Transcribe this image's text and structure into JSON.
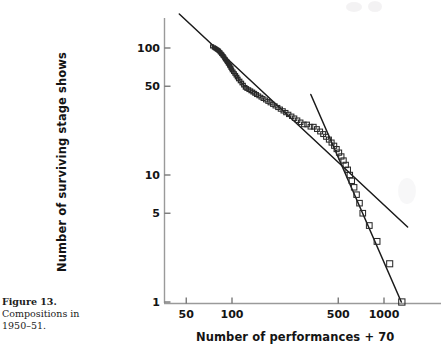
{
  "figure": {
    "caption_title": "Figure 13.",
    "caption_lines": [
      "Compositions in",
      "1950–51."
    ]
  },
  "style": {
    "ink": "#141414",
    "marker_stroke": "#2a2a2a",
    "axis_color": "#9a9a9a",
    "fit_line_color": "#1a1a1a",
    "background": "#ffffff"
  },
  "chart_data": {
    "type": "scatter",
    "title": "",
    "subtitle": "",
    "xlabel": "Number of performances + 70",
    "ylabel": "Number of surviving stage shows",
    "xscale": "log",
    "yscale": "log",
    "xlim": [
      42,
      1450
    ],
    "ylim": [
      0.88,
      215
    ],
    "grid": false,
    "legend": null,
    "xticks": [
      50,
      100,
      500,
      1000
    ],
    "xtick_labels": [
      "50",
      "100",
      "500",
      "1000"
    ],
    "yticks": [
      1,
      5,
      10,
      50,
      100
    ],
    "ytick_labels": [
      "1",
      "5",
      "10",
      "50",
      "100"
    ],
    "marker": "open-square",
    "points": [
      {
        "x": 74,
        "y": 103
      },
      {
        "x": 76,
        "y": 101
      },
      {
        "x": 77,
        "y": 100
      },
      {
        "x": 78,
        "y": 99
      },
      {
        "x": 79,
        "y": 98
      },
      {
        "x": 80,
        "y": 97
      },
      {
        "x": 81,
        "y": 96
      },
      {
        "x": 82,
        "y": 95
      },
      {
        "x": 83,
        "y": 93
      },
      {
        "x": 84,
        "y": 92
      },
      {
        "x": 85,
        "y": 90
      },
      {
        "x": 86,
        "y": 89
      },
      {
        "x": 87,
        "y": 87
      },
      {
        "x": 88,
        "y": 86
      },
      {
        "x": 89,
        "y": 84
      },
      {
        "x": 90,
        "y": 82
      },
      {
        "x": 91,
        "y": 81
      },
      {
        "x": 92,
        "y": 79
      },
      {
        "x": 93,
        "y": 78
      },
      {
        "x": 94,
        "y": 76
      },
      {
        "x": 95,
        "y": 75
      },
      {
        "x": 96,
        "y": 73
      },
      {
        "x": 97,
        "y": 72
      },
      {
        "x": 98,
        "y": 70
      },
      {
        "x": 99,
        "y": 69
      },
      {
        "x": 100,
        "y": 67
      },
      {
        "x": 102,
        "y": 65
      },
      {
        "x": 104,
        "y": 63
      },
      {
        "x": 106,
        "y": 61
      },
      {
        "x": 108,
        "y": 59
      },
      {
        "x": 110,
        "y": 57
      },
      {
        "x": 113,
        "y": 55
      },
      {
        "x": 116,
        "y": 53
      },
      {
        "x": 119,
        "y": 51
      },
      {
        "x": 122,
        "y": 49
      },
      {
        "x": 125,
        "y": 48
      },
      {
        "x": 129,
        "y": 47
      },
      {
        "x": 133,
        "y": 46
      },
      {
        "x": 137,
        "y": 45
      },
      {
        "x": 141,
        "y": 44
      },
      {
        "x": 145,
        "y": 43
      },
      {
        "x": 150,
        "y": 42
      },
      {
        "x": 155,
        "y": 41
      },
      {
        "x": 160,
        "y": 40
      },
      {
        "x": 166,
        "y": 39
      },
      {
        "x": 172,
        "y": 38
      },
      {
        "x": 178,
        "y": 37
      },
      {
        "x": 185,
        "y": 36
      },
      {
        "x": 192,
        "y": 35
      },
      {
        "x": 200,
        "y": 34
      },
      {
        "x": 208,
        "y": 33
      },
      {
        "x": 217,
        "y": 32
      },
      {
        "x": 226,
        "y": 31
      },
      {
        "x": 236,
        "y": 30
      },
      {
        "x": 247,
        "y": 29
      },
      {
        "x": 258,
        "y": 28
      },
      {
        "x": 270,
        "y": 27
      },
      {
        "x": 283,
        "y": 26
      },
      {
        "x": 297,
        "y": 25
      },
      {
        "x": 312,
        "y": 25
      },
      {
        "x": 328,
        "y": 24
      },
      {
        "x": 345,
        "y": 24
      },
      {
        "x": 362,
        "y": 23
      },
      {
        "x": 380,
        "y": 22
      },
      {
        "x": 398,
        "y": 21
      },
      {
        "x": 416,
        "y": 20
      },
      {
        "x": 434,
        "y": 19
      },
      {
        "x": 452,
        "y": 18
      },
      {
        "x": 470,
        "y": 17
      },
      {
        "x": 488,
        "y": 16
      },
      {
        "x": 506,
        "y": 15
      },
      {
        "x": 524,
        "y": 14
      },
      {
        "x": 542,
        "y": 13
      },
      {
        "x": 560,
        "y": 12
      },
      {
        "x": 578,
        "y": 11
      },
      {
        "x": 596,
        "y": 10
      },
      {
        "x": 614,
        "y": 9
      },
      {
        "x": 636,
        "y": 8
      },
      {
        "x": 660,
        "y": 7
      },
      {
        "x": 690,
        "y": 6
      },
      {
        "x": 725,
        "y": 5
      },
      {
        "x": 800,
        "y": 4
      },
      {
        "x": 900,
        "y": 3
      },
      {
        "x": 1090,
        "y": 2
      },
      {
        "x": 1310,
        "y": 1
      }
    ],
    "fit_lines": [
      {
        "name": "overall-power-law-fit",
        "slope_note": "shallow fit through full range",
        "x_start": 45,
        "y_start": 185,
        "x_end": 1430,
        "y_end": 3.9
      },
      {
        "name": "tail-power-law-fit",
        "slope_note": "steep fit through upper tail",
        "x_start": 330,
        "y_start": 43,
        "x_end": 1300,
        "y_end": 1.0
      }
    ]
  }
}
